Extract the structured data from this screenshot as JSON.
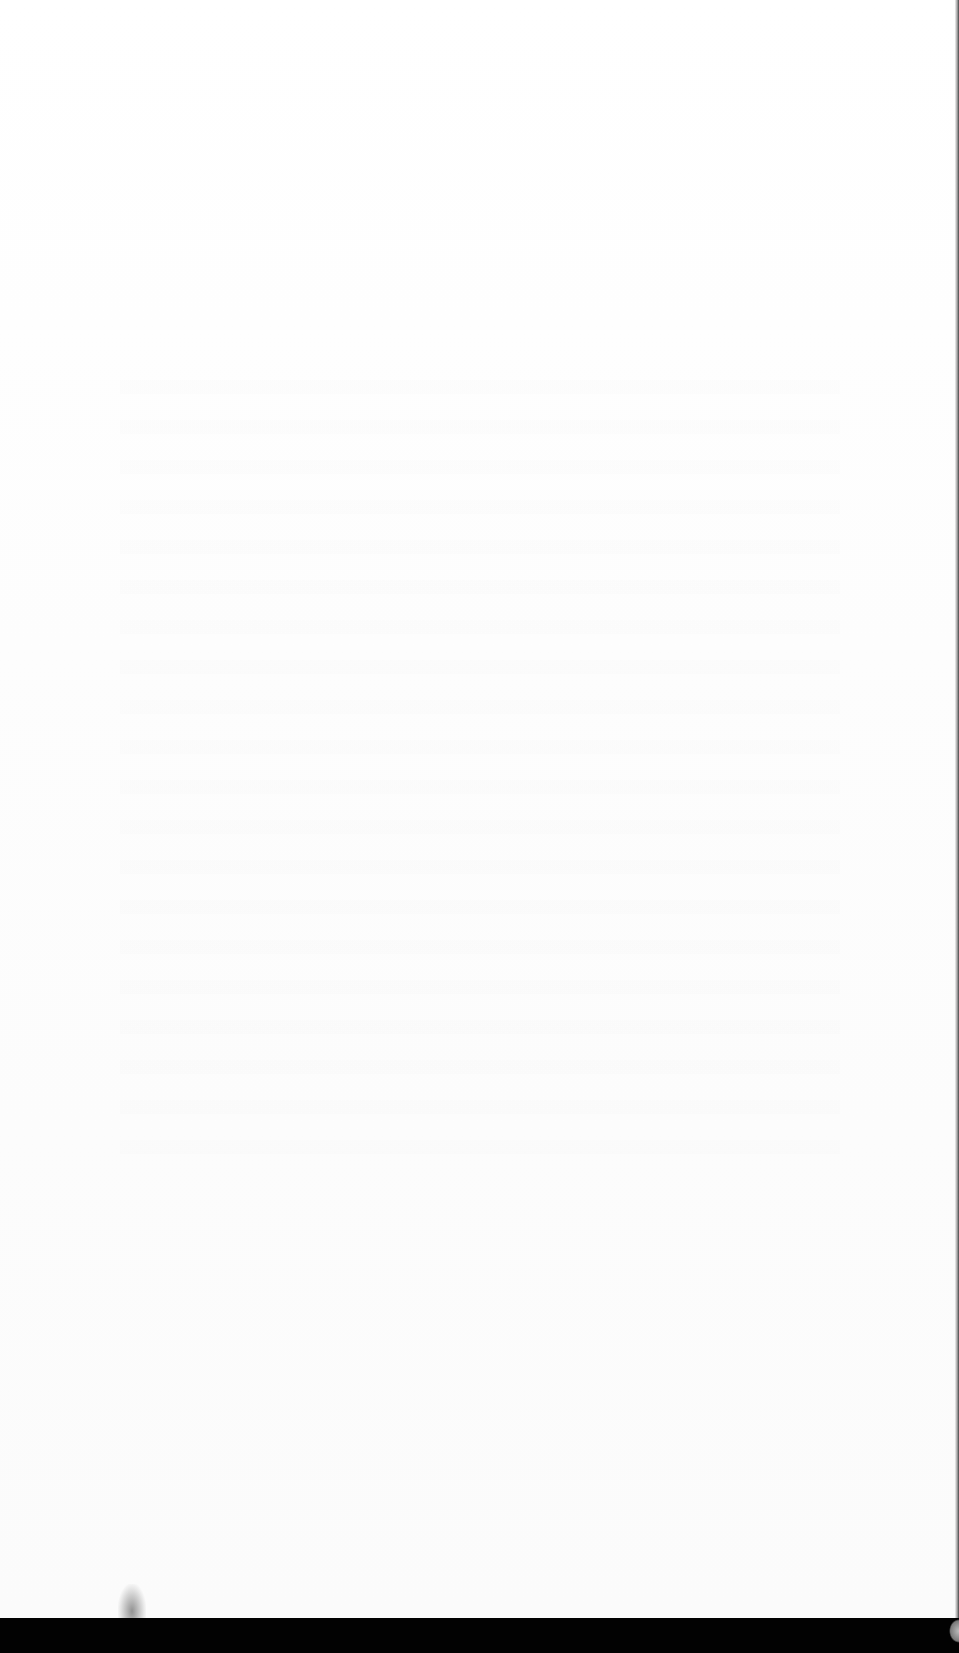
{
  "document": {
    "type": "scanned-page",
    "content": "",
    "state": "blank"
  },
  "colors": {
    "page": "#ffffff",
    "scanner_bed": "#020202"
  }
}
